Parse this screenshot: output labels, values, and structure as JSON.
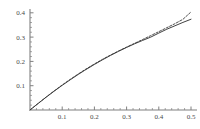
{
  "chart_data": {
    "type": "line",
    "title": "",
    "xlabel": "",
    "ylabel": "",
    "xlim": [
      0,
      0.52
    ],
    "ylim": [
      0,
      0.42
    ],
    "grid": false,
    "legend": "none",
    "xticks": [
      0.1,
      0.2,
      0.3,
      0.4,
      0.5
    ],
    "xtick_labels": [
      "0.1",
      "0.2",
      "0.3",
      "0.4",
      "0.5"
    ],
    "yticks": [
      0.1,
      0.2,
      0.3,
      0.4
    ],
    "ytick_labels": [
      "0.1",
      "0.2",
      "0.3",
      "0.4"
    ],
    "minor_ticks": true,
    "axis_color": "#808080",
    "series": [
      {
        "name": "solid-curve",
        "style": "solid",
        "color": "#2b2b2b",
        "x": [
          0.0,
          0.025,
          0.05,
          0.075,
          0.1,
          0.125,
          0.15,
          0.17,
          0.2,
          0.225,
          0.25,
          0.275,
          0.3,
          0.325,
          0.35,
          0.375,
          0.4,
          0.425,
          0.45,
          0.475,
          0.5
        ],
        "y": [
          0.0,
          0.0265,
          0.0525,
          0.0775,
          0.1015,
          0.1245,
          0.1465,
          0.1635,
          0.1875,
          0.2065,
          0.2245,
          0.2415,
          0.2575,
          0.2725,
          0.2865,
          0.3,
          0.3165,
          0.3325,
          0.3465,
          0.3605,
          0.3735
        ]
      },
      {
        "name": "dashed-curve",
        "style": "dashed",
        "color": "#3a3a3a",
        "x": [
          0.0,
          0.025,
          0.05,
          0.075,
          0.1,
          0.125,
          0.15,
          0.17,
          0.2,
          0.225,
          0.25,
          0.275,
          0.3,
          0.325,
          0.35,
          0.375,
          0.4,
          0.425,
          0.45,
          0.475,
          0.5
        ],
        "y": [
          0.0,
          0.0268,
          0.0532,
          0.0786,
          0.103,
          0.1262,
          0.1484,
          0.1655,
          0.1895,
          0.2084,
          0.2262,
          0.243,
          0.2589,
          0.2745,
          0.2902,
          0.3062,
          0.3224,
          0.3388,
          0.3552,
          0.3732,
          0.4035
        ]
      }
    ]
  },
  "plot": {
    "geometry": {
      "origin_x": 30,
      "origin_y": 110,
      "x_axis_end": 197,
      "y_axis_top": 9,
      "px_per_x_unit": 322,
      "px_per_y_unit": 243
    }
  }
}
